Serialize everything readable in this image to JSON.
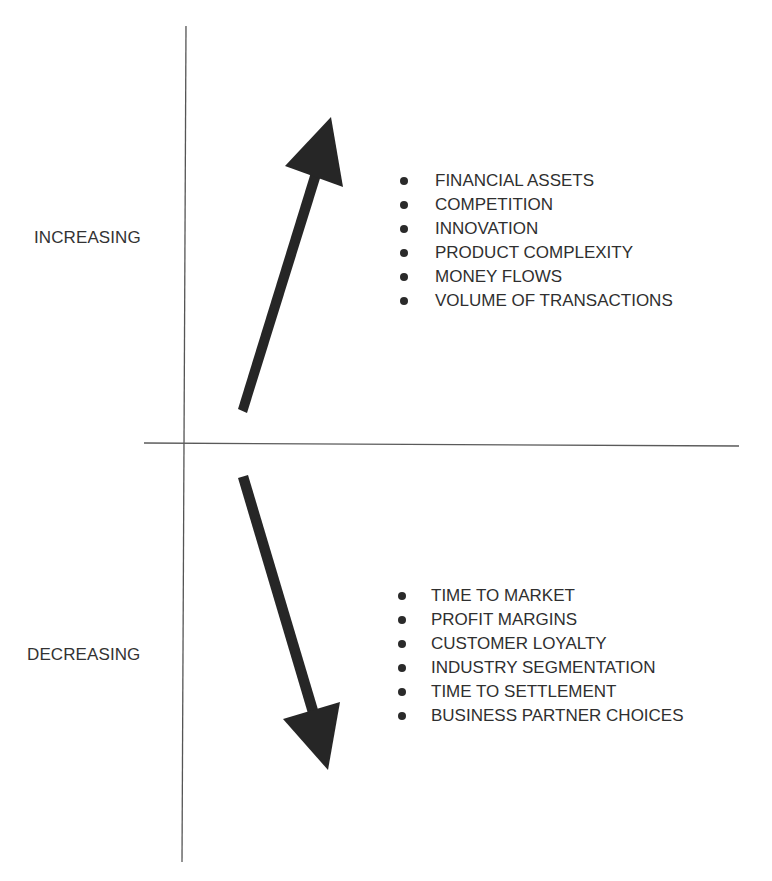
{
  "diagram": {
    "axes": {
      "vertical": {
        "x1": 186,
        "y1": 26,
        "x2": 182,
        "y2": 862,
        "color": "#555555"
      },
      "horizontal": {
        "x1": 144,
        "y1": 443,
        "x2": 739,
        "y2": 446,
        "color": "#555555"
      }
    },
    "regions": {
      "increasing": {
        "label": "INCREASING",
        "arrow_direction": "up",
        "items": [
          "FINANCIAL ASSETS",
          "COMPETITION",
          "INNOVATION",
          "PRODUCT COMPLEXITY",
          "MONEY FLOWS",
          "VOLUME OF TRANSACTIONS"
        ]
      },
      "decreasing": {
        "label": "DECREASING",
        "arrow_direction": "down",
        "items": [
          "TIME TO MARKET",
          "PROFIT MARGINS",
          "CUSTOMER LOYALTY",
          "INDUSTRY SEGMENTATION",
          "TIME TO SETTLEMENT",
          "BUSINESS PARTNER CHOICES"
        ]
      }
    },
    "colors": {
      "arrow": "#262626",
      "text": "#2f2f2f",
      "axis": "#555555",
      "background": "#ffffff"
    }
  }
}
